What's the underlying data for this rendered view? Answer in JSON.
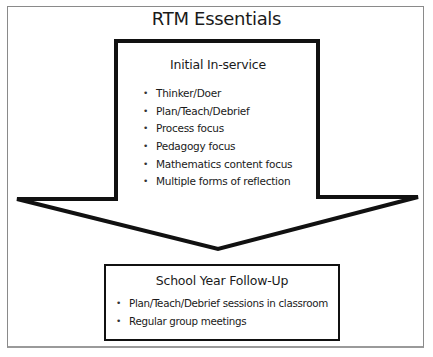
{
  "diagram": {
    "title": "RTM Essentials",
    "initial_inservice": {
      "heading": "Initial In-service",
      "items": [
        "Thinker/Doer",
        "Plan/Teach/Debrief",
        "Process focus",
        "Pedagogy focus",
        "Mathematics content focus",
        "Multiple forms of reflection"
      ]
    },
    "follow_up": {
      "heading": "School Year Follow-Up",
      "items": [
        "Plan/Teach/Debrief sessions in classroom",
        "Regular group meetings"
      ]
    },
    "colors": {
      "stroke": "#111111",
      "frame": "#8a8a8a",
      "background": "#ffffff"
    }
  }
}
